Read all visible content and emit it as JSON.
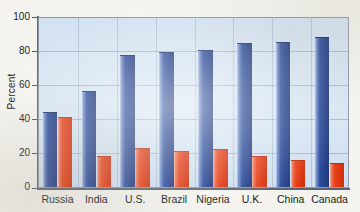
{
  "chart_data": {
    "type": "bar",
    "title": "",
    "xlabel": "",
    "ylabel": "Percent",
    "ylim": [
      0,
      100
    ],
    "yticks": [
      0,
      20,
      40,
      60,
      80,
      100
    ],
    "ytick_labels": [
      "0",
      "20",
      "40",
      "60",
      "80",
      "100"
    ],
    "grid": true,
    "legend": "none",
    "categories": [
      "Russia",
      "India",
      "U.S.",
      "Brazil",
      "Nigeria",
      "U.K.",
      "China",
      "Canada"
    ],
    "series": [
      {
        "name": "series-blue",
        "color": "#2a4a9e",
        "values": [
          44,
          56,
          77,
          79,
          80,
          84,
          85,
          88
        ]
      },
      {
        "name": "series-red",
        "color": "#e8401f",
        "values": [
          41,
          18,
          23,
          21,
          22,
          18,
          16,
          14
        ]
      }
    ]
  },
  "colors": {
    "plot_background": "#d6e4f0",
    "page_background": "#f4f3ee",
    "gridline": "#9fb3c8",
    "axis": "#5a6470",
    "blue": "#2a4a9e",
    "red": "#e8401f"
  }
}
